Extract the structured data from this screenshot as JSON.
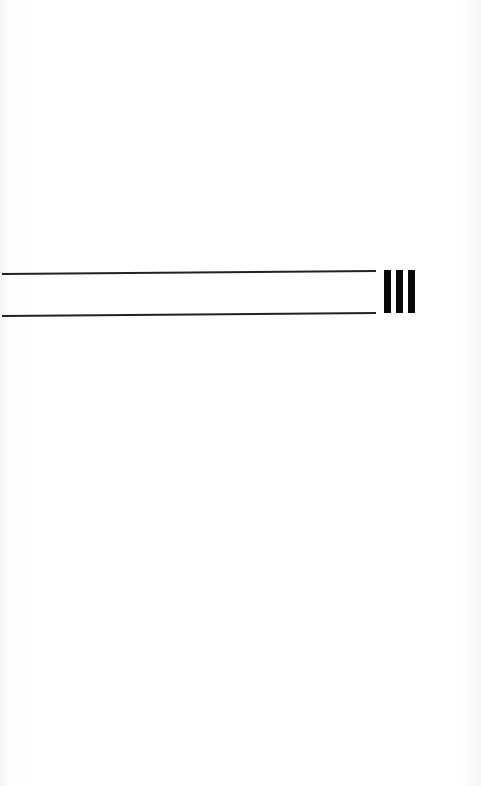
{
  "page": {
    "background": "#fbfbfb"
  },
  "staff": {
    "line_color": "#222222",
    "lines": [
      {
        "label": "top-staff-line"
      },
      {
        "label": "bottom-staff-line"
      }
    ]
  },
  "final_barline": {
    "bar_color": "#0a0a0a",
    "bars": 3
  }
}
